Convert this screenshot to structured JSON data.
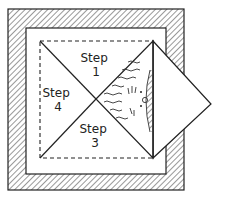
{
  "diagram": {
    "type": "folding-instructions",
    "regions": [
      {
        "id": "step1",
        "label_line1": "Step",
        "label_line2": "1"
      },
      {
        "id": "step4",
        "label_line1": "Step",
        "label_line2": "4"
      },
      {
        "id": "step3",
        "label_line1": "Step",
        "label_line2": "3"
      },
      {
        "id": "step2",
        "label_line1": "",
        "label_line2": "",
        "note": "folded-out flap with wavy illustration"
      }
    ],
    "colors": {
      "line": "#222222",
      "background": "#ffffff",
      "hatch": "#444444"
    }
  }
}
